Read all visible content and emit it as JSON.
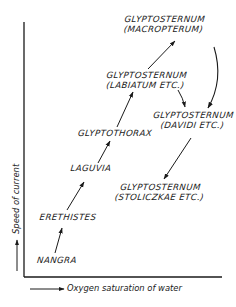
{
  "diagram": {
    "x_axis_label": "Oxygen saturation of water",
    "y_axis_label": "Speed of current",
    "nodes": [
      {
        "id": "nangra",
        "lines": [
          "NANGRA"
        ]
      },
      {
        "id": "erethistes",
        "lines": [
          "ERETHISTES"
        ]
      },
      {
        "id": "laguvia",
        "lines": [
          "LAGUVIA"
        ]
      },
      {
        "id": "glyptothorax",
        "lines": [
          "GLYPTOTHORAX"
        ]
      },
      {
        "id": "glyptosternum_labiatum",
        "lines": [
          "GLYPTOSTERNUM",
          "(LABIATUM ETC.)"
        ]
      },
      {
        "id": "glyptosternum_macropterum",
        "lines": [
          "GLYPTOSTERNUM",
          "(MACROPTERUM)"
        ]
      },
      {
        "id": "glyptosternum_davidi",
        "lines": [
          "GLYPTOSTERNUM",
          "(DAVIDI ETC.)"
        ]
      },
      {
        "id": "glyptosternum_stoliczkae",
        "lines": [
          "GLYPTOSTERNUM",
          "(STOLICZKAE ETC.)"
        ]
      }
    ],
    "edges": [
      {
        "from": "nangra",
        "to": "erethistes"
      },
      {
        "from": "erethistes",
        "to": "laguvia"
      },
      {
        "from": "laguvia",
        "to": "glyptothorax"
      },
      {
        "from": "glyptothorax",
        "to": "glyptosternum_labiatum"
      },
      {
        "from": "glyptosternum_labiatum",
        "to": "glyptosternum_macropterum"
      },
      {
        "from": "glyptosternum_labiatum",
        "to": "glyptosternum_davidi"
      },
      {
        "from": "glyptosternum_macropterum",
        "to": "glyptosternum_davidi"
      },
      {
        "from": "glyptosternum_davidi",
        "to": "glyptosternum_stoliczkae"
      }
    ],
    "colors": {
      "ink": "#1a1a1a",
      "background": "#ffffff"
    }
  }
}
